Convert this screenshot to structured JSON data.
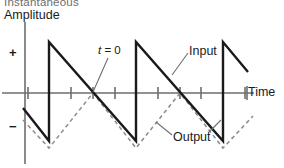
{
  "figure": {
    "background": "#ffffff",
    "axis_color": "#6e6e6e",
    "input_color": "#1a1a1a",
    "output_color": "#8c8c8c"
  },
  "axes": {
    "y_title_top": "Instantaneous",
    "y_title": "Amplitude",
    "x_label": "Time",
    "positive_mark": "+",
    "negative_mark": "−"
  },
  "annotations": {
    "t_zero_italic": "t",
    "t_zero_rest": " = 0",
    "input_label": "Input",
    "output_label": "Output"
  },
  "chart_data": {
    "type": "line",
    "xlabel": "Time",
    "ylabel": "Instantaneous Amplitude",
    "grid": false,
    "legend": "inline-annotations",
    "xlim": [
      0,
      284
    ],
    "ylim": [
      -1.4,
      1.4
    ],
    "axis_y_px": 93,
    "axis_x_px": 25,
    "peak_px": 42,
    "trough_px": 141,
    "period_px": 87,
    "t_zero_px": 93,
    "x_tick_positions_px": [
      28,
      49,
      71,
      93,
      115,
      136,
      158,
      180,
      201,
      223,
      245
    ],
    "series": [
      {
        "name": "Input",
        "style": "solid",
        "waveform": "sawtooth-falling",
        "color": "#1a1a1a",
        "points_px": [
          [
            23,
            108
          ],
          [
            49,
            141
          ],
          [
            49,
            42
          ],
          [
            136,
            141
          ],
          [
            136,
            42
          ],
          [
            223,
            141
          ],
          [
            223,
            42
          ],
          [
            248,
            72
          ]
        ]
      },
      {
        "name": "Output",
        "style": "dashed",
        "waveform": "triangle",
        "color": "#8c8c8c",
        "points_px": [
          [
            23,
            120
          ],
          [
            49,
            148
          ],
          [
            93,
            93
          ],
          [
            136,
            148
          ],
          [
            180,
            93
          ],
          [
            223,
            148
          ],
          [
            253,
            116
          ]
        ]
      }
    ]
  }
}
